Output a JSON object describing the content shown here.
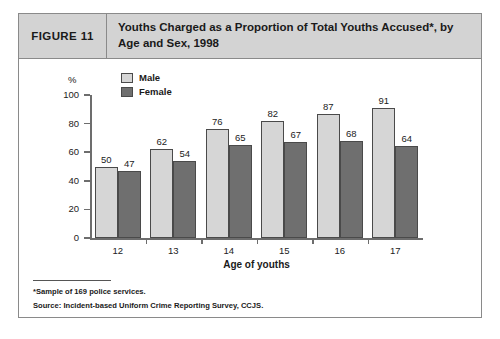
{
  "figure": {
    "number_label": "FIGURE 11",
    "title": "Youths Charged as a Proportion of Total Youths Accused*, by Age and Sex, 1998"
  },
  "footnotes": {
    "sample_note": "*Sample of 169 police services.",
    "source_note": "Source:  Incident-based Uniform Crime Reporting Survey, CCJS."
  },
  "colors": {
    "male_bar": "#d6d6d6",
    "female_bar": "#6f6f6f",
    "axis": "#6d6d6d",
    "header_band": "#d3d3d3",
    "border": "#8a8a8a"
  },
  "chart_data": {
    "type": "bar",
    "title": "Youths Charged as a Proportion of Total Youths Accused*, by Age and Sex, 1998",
    "xlabel": "Age of youths",
    "ylabel": "%",
    "ylim": [
      0,
      100
    ],
    "yticks": [
      0,
      20,
      40,
      60,
      80,
      100
    ],
    "ytick_labels": [
      "0",
      "20",
      "40",
      "60",
      "80",
      "100"
    ],
    "grid": false,
    "legend_position": "top-left",
    "categories": [
      "12",
      "13",
      "14",
      "15",
      "16",
      "17"
    ],
    "series": [
      {
        "name": "Male",
        "values": [
          50,
          62,
          76,
          82,
          87,
          91
        ]
      },
      {
        "name": "Female",
        "values": [
          47,
          54,
          65,
          67,
          68,
          64
        ]
      }
    ]
  }
}
